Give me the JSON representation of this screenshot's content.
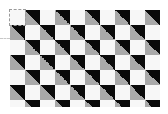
{
  "canvas": {
    "width": 168,
    "height": 114,
    "background": "#ffffff"
  },
  "pattern": {
    "type": "checkerboard-with-diagonal-triangles",
    "origin": [
      10,
      10
    ],
    "cell_size": 15,
    "columns": 10,
    "rows": 7,
    "visible_height": 97,
    "colors": {
      "plain_cell": "#f7f7f7",
      "triangle_upper_right": "#0a0a0a",
      "triangle_lower_left": "#a9a9a9"
    },
    "rule": "cells where (row+col) is odd are split diagonally (black upper-right, gray lower-left); others are plain light"
  },
  "selection": {
    "style": "dashed",
    "color": "#9a9a9a",
    "cell": [
      0,
      0
    ]
  }
}
